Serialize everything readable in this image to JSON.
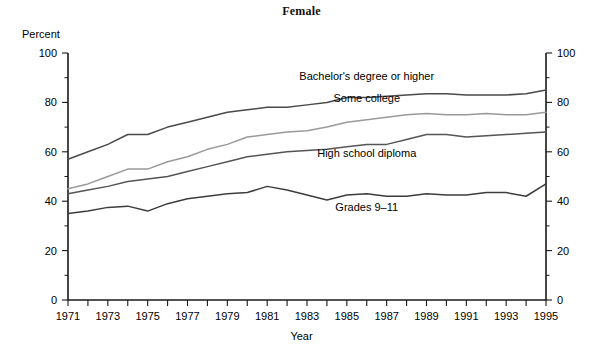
{
  "title": "Female",
  "axis": {
    "y_unit_label": "Percent",
    "x_title": "Year",
    "y_ticks": [
      "0",
      "20",
      "40",
      "60",
      "80",
      "100"
    ],
    "x_ticks": [
      "1971",
      "1973",
      "1975",
      "1977",
      "1979",
      "1981",
      "1983",
      "1985",
      "1987",
      "1989",
      "1991",
      "1993",
      "1995"
    ]
  },
  "series_labels": {
    "bachelors": "Bachelor's degree or higher",
    "some_college": "Some college",
    "high_school": "High school diploma",
    "grades": "Grades 9–11"
  },
  "colors": {
    "bachelors": "#4a4a4a",
    "some_college": "#9a9a9a",
    "high_school": "#555555",
    "grades": "#3d3d3d",
    "axis": "#1a1a1a",
    "background": "#ffffff"
  },
  "chart_data": {
    "type": "line",
    "title": "Female",
    "xlabel": "Year",
    "ylabel": "Percent",
    "xlim": [
      1971,
      1995
    ],
    "ylim": [
      0,
      100
    ],
    "grid": false,
    "legend": "inline-labels",
    "x": [
      1971,
      1972,
      1973,
      1974,
      1975,
      1976,
      1977,
      1978,
      1979,
      1980,
      1981,
      1982,
      1983,
      1984,
      1985,
      1986,
      1987,
      1988,
      1989,
      1990,
      1991,
      1992,
      1993,
      1994,
      1995
    ],
    "series": [
      {
        "name": "Bachelor's degree or higher",
        "color": "#4a4a4a",
        "values": [
          57,
          60,
          63,
          67,
          67,
          70,
          72,
          74,
          76,
          77,
          78,
          78,
          79,
          80,
          82,
          82,
          82.5,
          83,
          83.5,
          83.5,
          83,
          83,
          83,
          83.5,
          85
        ]
      },
      {
        "name": "Some college",
        "color": "#9a9a9a",
        "values": [
          45,
          47,
          50,
          53,
          53,
          56,
          58,
          61,
          63,
          66,
          67,
          68,
          68.5,
          70,
          72,
          73,
          74,
          75,
          75.5,
          75,
          75,
          75.5,
          75,
          75,
          76
        ]
      },
      {
        "name": "High school diploma",
        "color": "#555555",
        "values": [
          43,
          44.5,
          46,
          48,
          49,
          50,
          52,
          54,
          56,
          58,
          59,
          60,
          60.5,
          61,
          62,
          63,
          63,
          65,
          67,
          67,
          66,
          66.5,
          67,
          67.5,
          68
        ]
      },
      {
        "name": "Grades 9–11",
        "color": "#3d3d3d",
        "values": [
          35,
          36,
          37.5,
          38,
          36,
          39,
          41,
          42,
          43,
          43.5,
          46,
          44.5,
          42.5,
          40.5,
          42.5,
          43,
          42,
          42,
          43,
          42.5,
          42.5,
          43.5,
          43.5,
          42,
          47
        ]
      }
    ],
    "annotations": [
      {
        "text": "Bachelor's degree or higher",
        "x": 1986,
        "y": 89
      },
      {
        "text": "Some college",
        "x": 1986,
        "y": 80
      },
      {
        "text": "High school diploma",
        "x": 1986,
        "y": 58
      },
      {
        "text": "Grades 9–11",
        "x": 1986,
        "y": 36
      }
    ]
  }
}
